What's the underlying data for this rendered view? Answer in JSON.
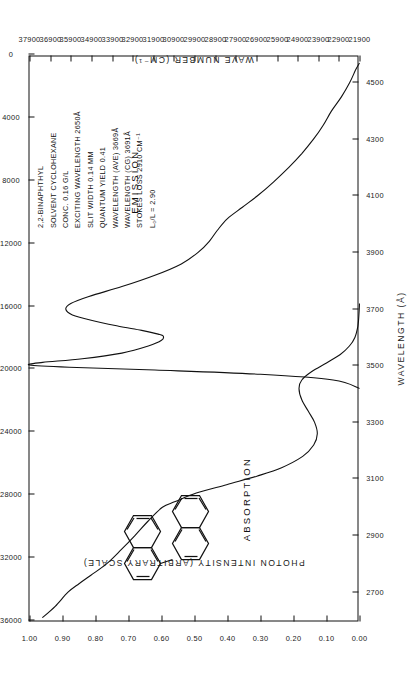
{
  "chart_data": {
    "type": "line",
    "title": "",
    "xlabel": "WAVELENGTH (Å)",
    "ylabel": "PHOTON INTENSITY (ARBITRARY SCALE)",
    "y2label": "MOLAR EXTINCTION COEFFICIENT (ε)",
    "x2label": "WAVE NUMBER (CM⁻¹)",
    "xlim": [
      2600,
      4600
    ],
    "xticks": [
      2700,
      2900,
      3100,
      3300,
      3500,
      3700,
      3900,
      4100,
      4300,
      4500
    ],
    "ylim": [
      0.0,
      1.0
    ],
    "yticks": [
      "0.00",
      "0.10",
      "0.20",
      "0.30",
      "0.40",
      "0.50",
      "0.60",
      "0.70",
      "0.80",
      "0.90",
      "1.00"
    ],
    "y2lim": [
      0,
      36000
    ],
    "y2ticks": [
      0,
      4000,
      8000,
      12000,
      16000,
      20000,
      24000,
      28000,
      32000,
      36000
    ],
    "x2lim": [
      21900,
      37900
    ],
    "x2ticks": [
      21900,
      22900,
      23900,
      24900,
      25900,
      26900,
      27900,
      28900,
      29900,
      30900,
      31900,
      32900,
      33900,
      34900,
      35900,
      36900,
      37900
    ],
    "grid": false,
    "legend_position": "inline-annotation",
    "series": [
      {
        "name": "ABSORPTION",
        "axis": "molar-extinction",
        "points": [
          [
            2610,
            34600
          ],
          [
            2650,
            33200
          ],
          [
            2700,
            31800
          ],
          [
            2730,
            30600
          ],
          [
            2760,
            29300
          ],
          [
            2800,
            27600
          ],
          [
            2850,
            26000
          ],
          [
            2900,
            24500
          ],
          [
            2950,
            23100
          ],
          [
            3000,
            21500
          ],
          [
            3020,
            20100
          ],
          [
            3050,
            17800
          ],
          [
            3080,
            14500
          ],
          [
            3110,
            11200
          ],
          [
            3140,
            8500
          ],
          [
            3180,
            6200
          ],
          [
            3220,
            5000
          ],
          [
            3260,
            4600
          ],
          [
            3300,
            4900
          ],
          [
            3340,
            5600
          ],
          [
            3380,
            6300
          ],
          [
            3420,
            6600
          ],
          [
            3450,
            6300
          ],
          [
            3480,
            5200
          ],
          [
            3510,
            3600
          ],
          [
            3540,
            2100
          ],
          [
            3570,
            1100
          ],
          [
            3600,
            500
          ],
          [
            3640,
            180
          ],
          [
            3680,
            60
          ],
          [
            3720,
            0
          ]
        ]
      },
      {
        "name": "EMISSION",
        "axis": "photon-intensity",
        "points": [
          [
            3420,
            0.0
          ],
          [
            3450,
            0.08
          ],
          [
            3470,
            0.3
          ],
          [
            3485,
            0.62
          ],
          [
            3495,
            0.88
          ],
          [
            3503,
            1.0
          ],
          [
            3512,
            0.96
          ],
          [
            3525,
            0.84
          ],
          [
            3545,
            0.72
          ],
          [
            3570,
            0.64
          ],
          [
            3590,
            0.6
          ],
          [
            3605,
            0.595
          ],
          [
            3612,
            0.61
          ],
          [
            3625,
            0.66
          ],
          [
            3640,
            0.73
          ],
          [
            3660,
            0.81
          ],
          [
            3680,
            0.87
          ],
          [
            3700,
            0.89
          ],
          [
            3720,
            0.875
          ],
          [
            3745,
            0.82
          ],
          [
            3780,
            0.72
          ],
          [
            3820,
            0.62
          ],
          [
            3860,
            0.54
          ],
          [
            3900,
            0.49
          ],
          [
            3940,
            0.455
          ],
          [
            3980,
            0.43
          ],
          [
            4020,
            0.4
          ],
          [
            4060,
            0.355
          ],
          [
            4100,
            0.31
          ],
          [
            4150,
            0.26
          ],
          [
            4200,
            0.215
          ],
          [
            4250,
            0.175
          ],
          [
            4300,
            0.14
          ],
          [
            4350,
            0.11
          ],
          [
            4400,
            0.085
          ],
          [
            4450,
            0.055
          ],
          [
            4500,
            0.03
          ],
          [
            4545,
            0.012
          ],
          [
            4570,
            0.0
          ]
        ]
      }
    ],
    "annotations": {
      "absorption_label": "ABSORPTION",
      "emission_label": "EMISSION",
      "structure_name": "2,2'-binaphthyl skeletal structure"
    }
  },
  "sample_info": {
    "lines": [
      "2,2-BINAPHTHYL",
      "SOLVENT  CYCLOHEXANE",
      "CONC.  0.16 G/L",
      "EXCITING WAVELENGTH  2650Å",
      "SLIT WIDTH  0.14 MM",
      "QUANTUM YIELD  0.41",
      "WAVELENGTH (AVE)  3669Å",
      "WAVELENGTH (CG)  3691Å",
      "STOKES LOSS  2910 CM⁻¹",
      "L₀/L = 2.90"
    ]
  },
  "colors": {
    "ink": "#111111",
    "background": "#ffffff"
  }
}
